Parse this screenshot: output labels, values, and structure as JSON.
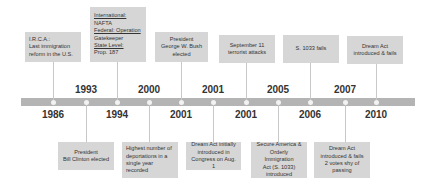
{
  "timeline": {
    "bar_color": "#b4b4b4",
    "box_color": "#d6d6d6",
    "events": [
      {
        "year": "1986",
        "lines": [
          "I.R.C.A.:",
          "Last immigration",
          "reform in the U.S."
        ]
      },
      {
        "year": "1993",
        "lines": [
          "President",
          "Bill Clinton elected"
        ]
      },
      {
        "year": "1994",
        "lines": [
          "International:",
          "NAFTA",
          "Federal: Operation",
          "Gatekeeper",
          "State Level:",
          "Prop. 187"
        ]
      },
      {
        "year": "2000",
        "lines": [
          "Highest number of",
          "deportations in a",
          "single year",
          "recorded"
        ]
      },
      {
        "year": "2001",
        "lines": [
          "President",
          "George W. Bush",
          "elected"
        ]
      },
      {
        "year": "2001",
        "lines": [
          "Dream Act initially",
          "introduced in",
          "Congress on Aug. 1"
        ]
      },
      {
        "year": "2001",
        "lines": [
          "September 11",
          "terrorist attacks"
        ]
      },
      {
        "year": "2005",
        "lines": [
          "Secure America &",
          "Orderly Immigration",
          "Act (S. 1033)",
          "introduced"
        ]
      },
      {
        "year": "2006",
        "lines": [
          "S. 1033 fails"
        ]
      },
      {
        "year": "2007",
        "lines": [
          "Dream Act",
          "introduced & fails",
          "2 votes shy of",
          "passing"
        ]
      },
      {
        "year": "2010",
        "lines": [
          "Dream Act",
          "introduced & fails"
        ]
      }
    ]
  }
}
